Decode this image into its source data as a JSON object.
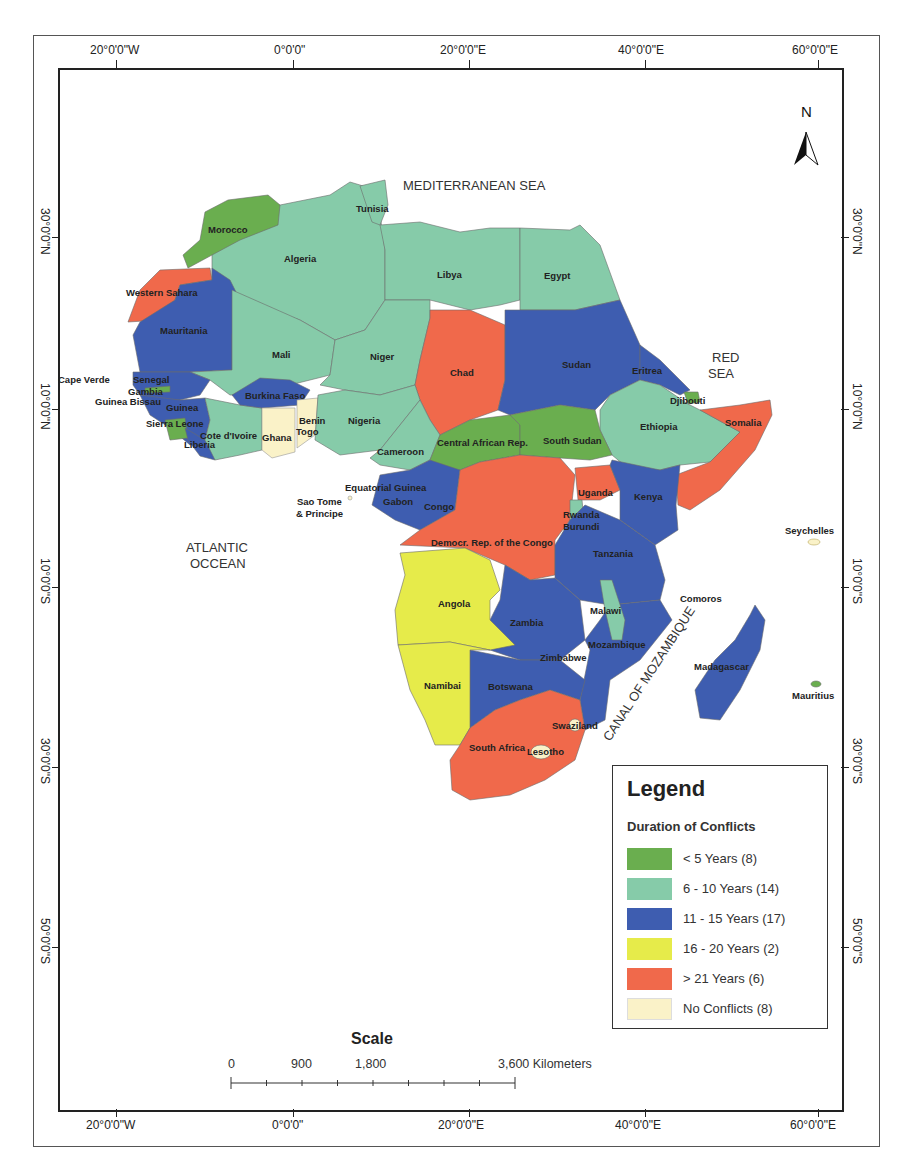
{
  "map": {
    "title": "Duration of Conflicts in Africa",
    "north_arrow_label": "N",
    "top_axis_labels": [
      "20°0'0\"W",
      "0°0'0\"",
      "20°0'0\"E",
      "40°0'0\"E",
      "60°0'0\"E"
    ],
    "bottom_axis_labels": [
      "20°0'0\"W",
      "0°0'0\"",
      "20°0'0\"E",
      "40°0'0\"E",
      "60°0'0\"E"
    ],
    "left_axis_labels": [
      "30°0'0\"N",
      "10°0'0\"N",
      "10°0'0\"S",
      "30°0'0\"S",
      "50°0'0\"S"
    ],
    "right_axis_labels": [
      "30°0'0\"N",
      "10°0'0\"N",
      "10°0'0\"S",
      "30°0'0\"S",
      "50°0'0\"S"
    ],
    "seas": {
      "mediterranean": "MEDITERRANEAN SEA",
      "red_sea_line1": "RED",
      "red_sea_line2": "SEA",
      "atlantic_line1": "ATLANTIC",
      "atlantic_line2": "OCCEAN",
      "mozambique": "CANAL OF MOZAMBIQUE"
    },
    "countries": {
      "morocco": "Morocco",
      "algeria": "Algeria",
      "tunisia": "Tunisia",
      "libya": "Libya",
      "egypt": "Egypt",
      "western_sahara": "Western Sahara",
      "mauritania": "Mauritania",
      "mali": "Mali",
      "niger": "Niger",
      "chad": "Chad",
      "sudan": "Sudan",
      "eritrea": "Eritrea",
      "djibouti": "Djibouti",
      "ethiopia": "Ethiopia",
      "somalia": "Somalia",
      "cape_verde": "Cape Verde",
      "senegal": "Senegal",
      "gambia": "Gambia",
      "guinea_bissau": "Guinea Bissau",
      "guinea": "Guinea",
      "sierra_leone": "Sierra Leone",
      "liberia": "Liberia",
      "cote_divoire": "Cote d'Ivoire",
      "burkina_faso": "Burkina Faso",
      "ghana": "Ghana",
      "benin": "Benin",
      "togo": "Togo",
      "nigeria": "Nigeria",
      "cameroon": "Cameroon",
      "car": "Central African Rep.",
      "south_sudan": "South Sudan",
      "equatorial_guinea": "Equatorial Guinea",
      "gabon": "Gabon",
      "congo": "Congo",
      "sao_tome_1": "Sao Tome",
      "sao_tome_2": "& Principe",
      "drc": "Democr. Rep. of the Congo",
      "uganda": "Uganda",
      "kenya": "Kenya",
      "rwanda": "Rwanda",
      "burundi": "Burundi",
      "tanzania": "Tanzania",
      "angola": "Angola",
      "zambia": "Zambia",
      "malawi": "Malawi",
      "mozambique": "Mozambique",
      "zimbabwe": "Zimbabwe",
      "namibia": "Namibai",
      "botswana": "Botswana",
      "swaziland": "Swaziland",
      "south_africa": "South Africa",
      "lesotho": "Lesotho",
      "madagascar": "Madagascar",
      "comoros": "Comoros",
      "seychelles": "Seychelles",
      "mauritius": "Mauritius"
    }
  },
  "legend": {
    "title": "Legend",
    "subtitle": "Duration of Conflicts",
    "items": [
      {
        "label": "< 5 Years (8)",
        "color": "#6aae4f"
      },
      {
        "label": "6 - 10 Years (14)",
        "color": "#86cba9"
      },
      {
        "label": "11 - 15 Years (17)",
        "color": "#3e5db0"
      },
      {
        "label": "16 - 20 Years (2)",
        "color": "#e6eb4a"
      },
      {
        "label": "> 21 Years (6)",
        "color": "#f0694b"
      },
      {
        "label": "No Conflicts (8)",
        "color": "#faf2c8"
      }
    ]
  },
  "scale": {
    "title": "Scale",
    "labels": [
      "0",
      "900",
      "1,800",
      "3,600 Kilometers"
    ]
  }
}
